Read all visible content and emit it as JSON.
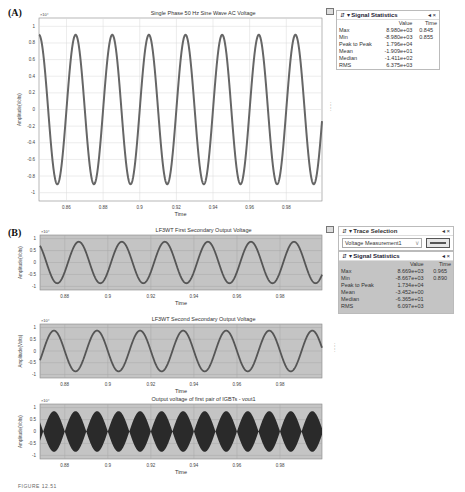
{
  "figure_caption": "FIGURE 12.51",
  "panelA": {
    "label": "(A)",
    "toggle_icon": "legend-toggle-icon",
    "stats": {
      "title": "Signal Statistics",
      "header_icons": "⇵ ▾",
      "controls": "◂ ×",
      "col_value": "Value",
      "col_time": "Time",
      "rows": [
        {
          "name": "Max",
          "value": "8.980e+03",
          "time": "0.845"
        },
        {
          "name": "Min",
          "value": "-8.980e+03",
          "time": "0.855"
        },
        {
          "name": "Peak to Peak",
          "value": "1.796e+04",
          "time": ""
        },
        {
          "name": "Mean",
          "value": "-1.909e+01",
          "time": ""
        },
        {
          "name": "Median",
          "value": "-1.411e+02",
          "time": ""
        },
        {
          "name": "RMS",
          "value": "6.375e+03",
          "time": ""
        }
      ]
    }
  },
  "panelB": {
    "label": "(B)",
    "trace": {
      "title": "Trace Selection",
      "header_icons": "⇵ ▾",
      "controls": "◂ ×",
      "selected": "Voltage Measurement1",
      "dropdown_arrow": "∨"
    },
    "stats": {
      "title": "Signal Statistics",
      "header_icons": "⇵ ▾",
      "controls": "◂ ×",
      "col_value": "Value",
      "col_time": "Time",
      "rows": [
        {
          "name": "Max",
          "value": "8.669e+03",
          "time": "0.965"
        },
        {
          "name": "Min",
          "value": "-8.667e+03",
          "time": "0.890"
        },
        {
          "name": "Peak to Peak",
          "value": "1.734e+04",
          "time": ""
        },
        {
          "name": "Mean",
          "value": "-3.452e+00",
          "time": ""
        },
        {
          "name": "Median",
          "value": "-6.365e+01",
          "time": ""
        },
        {
          "name": "RMS",
          "value": "6.097e+03",
          "time": ""
        }
      ]
    }
  },
  "chart_data": [
    {
      "type": "line",
      "id": "A",
      "title": "Single Phase 50 Hz Sine Wave AC Voltage",
      "xlabel": "Time",
      "ylabel": "Amplitude(Volts)",
      "y_multiplier": "×10⁴",
      "xlim": [
        0.845,
        0.9995
      ],
      "ylim": [
        -1.1,
        1.1
      ],
      "x_ticks": [
        "0.86",
        "0.88",
        "0.9",
        "0.92",
        "0.94",
        "0.96",
        "0.98"
      ],
      "x_tick_values": [
        0.86,
        0.88,
        0.9,
        0.92,
        0.94,
        0.96,
        0.98
      ],
      "y_ticks": [
        "1",
        "0.8",
        "0.6",
        "0.4",
        "0.2",
        "0",
        "-0.2",
        "-0.4",
        "-0.6",
        "-0.8",
        "-1"
      ],
      "y_tick_values": [
        1,
        0.8,
        0.6,
        0.4,
        0.2,
        0,
        -0.2,
        -0.4,
        -0.6,
        -0.8,
        -1
      ],
      "grid": true,
      "background": "#ffffff",
      "series": [
        {
          "name": "Voltage",
          "amplitude": 0.898,
          "frequency_hz": 50,
          "peak_time": 0.845,
          "color": "#666666",
          "style": "sine"
        }
      ]
    },
    {
      "type": "line",
      "id": "B1",
      "title": "LF3WT First Secondary Output Voltage",
      "xlabel": "Time",
      "ylabel": "Amplitude(Volts)",
      "y_multiplier": "×10⁴",
      "xlim": [
        0.8685,
        0.9995
      ],
      "ylim": [
        -1.15,
        1.15
      ],
      "x_ticks": [
        "0.88",
        "0.9",
        "0.92",
        "0.94",
        "0.96",
        "0.98"
      ],
      "x_tick_values": [
        0.88,
        0.9,
        0.92,
        0.94,
        0.96,
        0.98
      ],
      "y_ticks": [
        "1",
        "0.5",
        "0",
        "-0.5",
        "-1"
      ],
      "y_tick_values": [
        1,
        0.5,
        0,
        -0.5,
        -1
      ],
      "grid": true,
      "background": "#c4c4c4",
      "series": [
        {
          "name": "Vout1",
          "amplitude": 0.867,
          "frequency_hz": 50,
          "peak_time": 0.8665,
          "color": "#555555",
          "style": "sine"
        }
      ]
    },
    {
      "type": "line",
      "id": "B2",
      "title": "LF3WT Second Secondary Output Voltage",
      "xlabel": "Time",
      "ylabel": "Amplitude(Volts)",
      "y_multiplier": "×10⁴",
      "xlim": [
        0.8685,
        0.9995
      ],
      "ylim": [
        -1.15,
        1.15
      ],
      "x_ticks": [
        "0.88",
        "0.9",
        "0.92",
        "0.94",
        "0.96",
        "0.98"
      ],
      "x_tick_values": [
        0.88,
        0.9,
        0.92,
        0.94,
        0.96,
        0.98
      ],
      "y_ticks": [
        "1",
        "0.5",
        "0",
        "-0.5",
        "-1"
      ],
      "y_tick_values": [
        1,
        0.5,
        0,
        -0.5,
        -1
      ],
      "grid": true,
      "background": "#c4c4c4",
      "series": [
        {
          "name": "Vout2",
          "amplitude": 0.867,
          "frequency_hz": 50,
          "peak_time": 0.875,
          "color": "#555555",
          "style": "sine"
        }
      ]
    },
    {
      "type": "area",
      "id": "B3",
      "title": "Output voltage of first pair of IGBTs - vout1",
      "xlabel": "Time",
      "ylabel": "Amplitude(Volts)",
      "y_multiplier": "×10⁴",
      "xlim": [
        0.8685,
        0.9995
      ],
      "ylim": [
        -1.15,
        1.15
      ],
      "x_ticks": [
        "0.88",
        "0.9",
        "0.92",
        "0.94",
        "0.96",
        "0.98"
      ],
      "x_tick_values": [
        0.88,
        0.9,
        0.92,
        0.94,
        0.96,
        0.98
      ],
      "y_ticks": [
        "1",
        "0.5",
        "0",
        "-0.5",
        "-1"
      ],
      "y_tick_values": [
        1,
        0.5,
        0,
        -0.5,
        -1
      ],
      "grid": true,
      "background": "#c4c4c4",
      "series": [
        {
          "name": "vout1 PWM envelope",
          "amplitude": 0.85,
          "frequency_hz": 50,
          "style": "rectified-envelope",
          "color": "#2a2a2a"
        }
      ]
    }
  ]
}
